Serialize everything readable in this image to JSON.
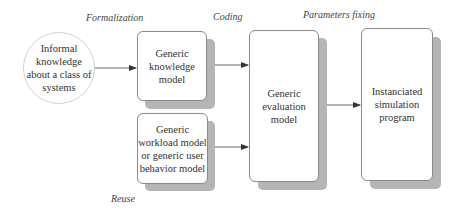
{
  "diagram": {
    "phases": {
      "formalization": "Formalization",
      "coding": "Coding",
      "parameters_fixing": "Parameters fixing",
      "reuse": "Reuse"
    },
    "nodes": {
      "informal_knowledge": {
        "shape": "circle",
        "lines": [
          "Informal",
          "knowledge",
          "about a class of",
          "systems"
        ]
      },
      "generic_knowledge_model": {
        "shape": "rounded-rect-shadow",
        "lines": [
          "Generic",
          "knowledge",
          "model"
        ]
      },
      "generic_workload_model": {
        "shape": "rounded-rect-shadow",
        "lines": [
          "Generic",
          "workload model",
          "or generic user",
          "behavior model"
        ]
      },
      "generic_evaluation_model": {
        "shape": "rounded-rect-shadow",
        "lines": [
          "Generic",
          "evaluation",
          "model"
        ]
      },
      "instanciated_simulation_program": {
        "shape": "rounded-rect-shadow",
        "lines": [
          "Instanciated",
          "simulation",
          "program"
        ]
      }
    },
    "edges": [
      {
        "from": "informal_knowledge",
        "to": "generic_knowledge_model"
      },
      {
        "from": "generic_knowledge_model",
        "to": "generic_evaluation_model"
      },
      {
        "from": "generic_workload_model",
        "to": "generic_evaluation_model"
      },
      {
        "from": "generic_evaluation_model",
        "to": "instanciated_simulation_program"
      }
    ],
    "colors": {
      "shadow": "#b5b5b5",
      "box_border": "#8a8a8a",
      "circle_border": "#d0d0d0",
      "arrow": "#555555",
      "text": "#333333"
    }
  }
}
